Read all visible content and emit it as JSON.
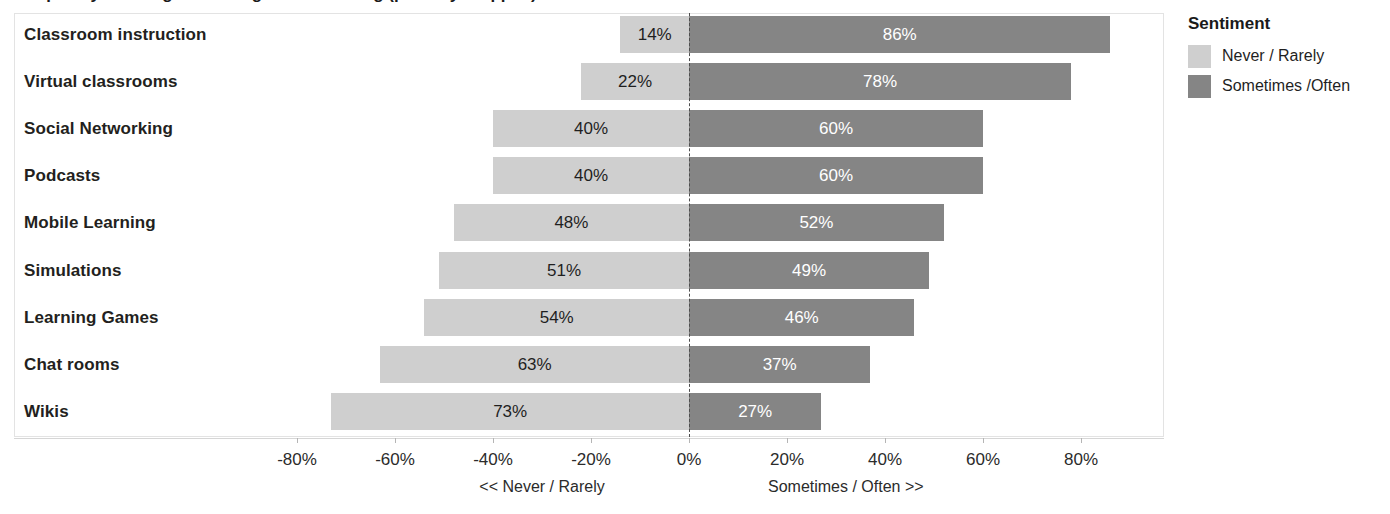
{
  "chart_data": {
    "type": "bar",
    "subtype": "diverging-stacked-horizontal-bar",
    "title": "Frequency of Using Technologies in Teaching (partially cropped)",
    "categories": [
      "Classroom instruction",
      "Virtual classrooms",
      "Social Networking",
      "Podcasts",
      "Mobile Learning",
      "Simulations",
      "Learning Games",
      "Chat rooms",
      "Wikis"
    ],
    "series": [
      {
        "name": "Never / Rarely",
        "color": "#cfcfcf",
        "values": [
          14,
          22,
          40,
          40,
          48,
          51,
          54,
          63,
          73
        ],
        "labels": [
          "14%",
          "22%",
          "40%",
          "40%",
          "48%",
          "51%",
          "54%",
          "63%",
          "73%"
        ],
        "direction": "left"
      },
      {
        "name": "Sometimes /Often",
        "color": "#858585",
        "values": [
          86,
          78,
          60,
          60,
          52,
          49,
          46,
          37,
          27
        ],
        "labels": [
          "86%",
          "78%",
          "60%",
          "60%",
          "52%",
          "49%",
          "46%",
          "37%",
          "27%"
        ],
        "direction": "right"
      }
    ],
    "xlabel": "",
    "ylabel": "",
    "xlim": [
      -90,
      90
    ],
    "xticks": [
      -80,
      -60,
      -40,
      -20,
      0,
      20,
      40,
      60,
      80
    ],
    "xtick_labels": [
      "-80%",
      "-60%",
      "-40%",
      "-20%",
      "0%",
      "20%",
      "40%",
      "60%",
      "80%"
    ],
    "axis_captions": {
      "left": "<< Never / Rarely",
      "right": "Sometimes / Often >>"
    },
    "grid": false,
    "zero_reference_line": true,
    "legend": {
      "title": "Sentiment",
      "position": "right",
      "entries": [
        {
          "label": "Never / Rarely",
          "color": "#cfcfcf"
        },
        {
          "label": "Sometimes /Often",
          "color": "#858585"
        }
      ]
    }
  }
}
